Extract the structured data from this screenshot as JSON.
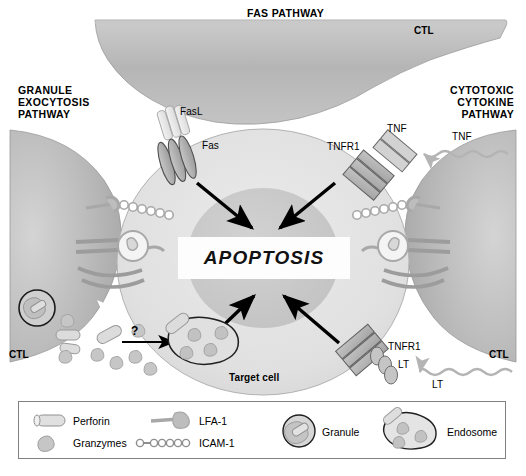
{
  "figure": {
    "background_color": "#ffffff"
  },
  "headings": {
    "fas_pathway": "FAS PATHWAY",
    "granule_exocytosis_pathway": "GRANULE\nEXOCYTOSIS\nPATHWAY",
    "cytotoxic_cytokine_pathway": "CYTOTOXIC\nCYTOKINE\nPATHWAY"
  },
  "cells": {
    "ctl_top": "CTL",
    "ctl_left": "CTL",
    "ctl_right": "CTL",
    "target_cell": "Target cell",
    "center_label": "APOPTOSIS"
  },
  "molecules": {
    "fasl": "FasL",
    "fas": "Fas",
    "tnf_ligand_top": "TNF",
    "tnfr1_top": "TNFR1",
    "tnf_cytokine": "TNF",
    "tnfr1_bottom": "TNFR1",
    "lt_receptor": "LT",
    "lt_cytokine": "LT",
    "question_mark": "?"
  },
  "legend": {
    "items": [
      {
        "key": "perforin",
        "label": "Perforin",
        "icon": "perforin-cylinder-icon"
      },
      {
        "key": "granzymes",
        "label": "Granzymes",
        "icon": "granzyme-blob-icon"
      },
      {
        "key": "lfa1",
        "label": "LFA-1",
        "icon": "lfa1-rod-icon"
      },
      {
        "key": "icam1",
        "label": "ICAM-1",
        "icon": "icam1-beads-icon"
      },
      {
        "key": "granule",
        "label": "Granule",
        "icon": "granule-circle-icon"
      },
      {
        "key": "endosome",
        "label": "Endosome",
        "icon": "endosome-oval-icon"
      }
    ]
  },
  "colors": {
    "ctl_fill": "#b9b9b9",
    "target_fill": "#e2e2e2",
    "nucleus_fill": "#c9c9c9",
    "receptor_fill": "#b0b0b0",
    "outline": "#6e6e6e",
    "arrow": "#000000",
    "legend_border": "#808080",
    "text": "#000000"
  }
}
